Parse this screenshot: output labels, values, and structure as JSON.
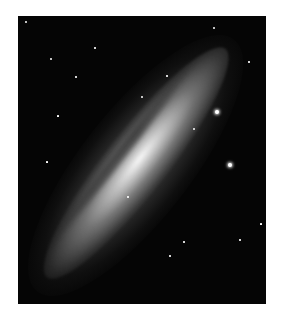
{
  "image": {
    "subject": "edge-on spiral galaxy",
    "description": "Black-and-white astronomical photograph of an elongated spiral galaxy seen nearly edge-on, oriented diagonally from lower-left to upper-right, surrounded by scattered foreground stars",
    "colors": {
      "background": "#ffffff",
      "sky": "#050505",
      "core": "#ffffff"
    }
  },
  "stars": [
    {
      "x": 8,
      "y": 6,
      "r": 1
    },
    {
      "x": 33,
      "y": 43,
      "r": 1
    },
    {
      "x": 77,
      "y": 32,
      "r": 0.8
    },
    {
      "x": 58,
      "y": 61,
      "r": 0.8
    },
    {
      "x": 124,
      "y": 81,
      "r": 1.2
    },
    {
      "x": 149,
      "y": 60,
      "r": 0.8
    },
    {
      "x": 199,
      "y": 96,
      "r": 2,
      "big": true
    },
    {
      "x": 212,
      "y": 149,
      "r": 2,
      "big": true
    },
    {
      "x": 176,
      "y": 113,
      "r": 1
    },
    {
      "x": 231,
      "y": 46,
      "r": 0.8
    },
    {
      "x": 196,
      "y": 12,
      "r": 1
    },
    {
      "x": 110,
      "y": 181,
      "r": 0.8
    },
    {
      "x": 166,
      "y": 226,
      "r": 0.8
    },
    {
      "x": 222,
      "y": 224,
      "r": 0.8
    },
    {
      "x": 152,
      "y": 240,
      "r": 0.8
    },
    {
      "x": 40,
      "y": 100,
      "r": 0.6
    },
    {
      "x": 29,
      "y": 146,
      "r": 0.6
    },
    {
      "x": 243,
      "y": 208,
      "r": 0.6
    },
    {
      "x": 238,
      "y": 300,
      "r": 0.6
    }
  ]
}
